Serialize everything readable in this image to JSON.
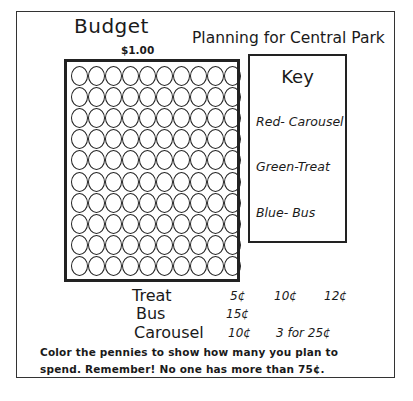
{
  "worksheet": {
    "budget_label": "Budget",
    "title": "Planning for Central Park",
    "amount_label": "$1.00",
    "penny_grid": {
      "rows": 10,
      "columns": 10,
      "total": 100
    },
    "key": {
      "title": "Key",
      "items": [
        {
          "label": "Red- Carousel",
          "color": "red",
          "activity": "Carousel"
        },
        {
          "label": "Green-Treat",
          "color": "green",
          "activity": "Treat"
        },
        {
          "label": "Blue- Bus",
          "color": "blue",
          "activity": "Bus"
        }
      ]
    },
    "prices": [
      {
        "item": "Treat",
        "values": [
          "5¢",
          "10¢",
          "12¢"
        ]
      },
      {
        "item": "Bus",
        "values": [
          "15¢"
        ]
      },
      {
        "item": "Carousel",
        "values": [
          "10¢",
          "3 for 25¢"
        ]
      }
    ],
    "instructions": [
      "Color the pennies to show how many you plan to",
      "spend. Remember!  No one has more than  75¢."
    ]
  }
}
